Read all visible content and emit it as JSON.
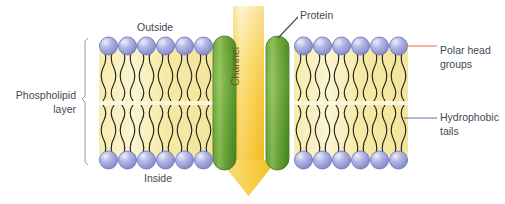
{
  "figure": {
    "background_color": "#ffffff"
  },
  "labels": {
    "outside": "Outside",
    "inside": "Inside",
    "protein": "Protein",
    "channel": "Channel",
    "polar_head_groups": "Polar head\ngroups",
    "hydrophobic_tails": "Hydrophobic\ntails",
    "phospholipid_layer": "Phospholipid\nlayer"
  },
  "colors": {
    "head_fill": "#9aa0d8",
    "head_edge": "#6f76b8",
    "head_highlight": "#e4e7f7",
    "tail_region": "#f7edb0",
    "tail_stroke": "#2b2b20",
    "protein_green_light": "#86bb52",
    "protein_green_dark": "#4c8a2a",
    "arrow_yellow": "#f7c938",
    "arrow_yellow_light": "#fdf3cf",
    "leader_polar": "#e8826a",
    "leader_tails": "#6d6fb0",
    "text": "#3f4a55",
    "channel_text": "#6a5a22",
    "bracket": "#8a8a8a"
  },
  "structure": {
    "leaflets": [
      "outer",
      "inner"
    ],
    "left_block_heads_per_row": 6,
    "right_block_heads_per_row": 6,
    "protein_subunits": 2,
    "channel_direction": "downward",
    "membrane_top_y": 38,
    "membrane_bottom_y": 168
  },
  "leader_lines": [
    {
      "name": "polar-head-leader",
      "color": "#e8826a",
      "from": "outer head right block",
      "to": "Polar head groups"
    },
    {
      "name": "hydrophobic-tails-leader",
      "color": "#6d6fb0",
      "from": "inner leaflet tails",
      "to": "Hydrophobic tails"
    },
    {
      "name": "protein-leader",
      "color": "#3f4a55",
      "from": "right protein subunit top",
      "to": "Protein"
    }
  ]
}
